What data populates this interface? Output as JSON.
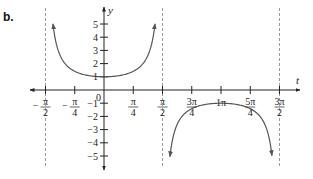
{
  "panel_label": "b.",
  "chart_data": {
    "type": "line",
    "function": "y = sec(t)",
    "title": "",
    "xlabel": "t",
    "ylabel": "y",
    "xlim": [
      -1.7,
      5.1
    ],
    "ylim": [
      -5.6,
      5.6
    ],
    "grid": false,
    "x_ticks": [
      {
        "value": -1.5708,
        "label_num": "π",
        "label_den": "2",
        "sign": "−"
      },
      {
        "value": -0.7854,
        "label_num": "π",
        "label_den": "4",
        "sign": "−"
      },
      {
        "value": 0.7854,
        "label_num": "π",
        "label_den": "4",
        "sign": ""
      },
      {
        "value": 1.5708,
        "label_num": "π",
        "label_den": "2",
        "sign": ""
      },
      {
        "value": 2.3562,
        "label_num": "3π",
        "label_den": "4",
        "sign": ""
      },
      {
        "value": 3.1416,
        "label_plain": "1π"
      },
      {
        "value": 3.927,
        "label_num": "5π",
        "label_den": "4",
        "sign": ""
      },
      {
        "value": 4.7124,
        "label_num": "3π",
        "label_den": "2",
        "sign": ""
      }
    ],
    "origin_label": "0",
    "y_ticks": [
      {
        "value": 5,
        "label": "5"
      },
      {
        "value": 4,
        "label": "4"
      },
      {
        "value": 3,
        "label": "3"
      },
      {
        "value": 2,
        "label": "2"
      },
      {
        "value": 1,
        "label": "1"
      },
      {
        "value": -1,
        "label": "−1"
      },
      {
        "value": -2,
        "label": "−2"
      },
      {
        "value": -3,
        "label": "−3"
      },
      {
        "value": -4,
        "label": "−4"
      },
      {
        "value": -5,
        "label": "−5"
      }
    ],
    "asymptotes": [
      -1.5708,
      1.5708,
      4.7124
    ],
    "series": [
      {
        "name": "upper branch",
        "domain": [
          -1.37,
          1.37
        ],
        "values_note": "sec(t) ≥ 1, minimum (0, 1)"
      },
      {
        "name": "lower branch",
        "domain": [
          1.77,
          4.51
        ],
        "values_note": "sec(t) ≤ −1, maximum (π, −1)"
      }
    ],
    "colors": {
      "curve": "#555555",
      "axes": "#222222",
      "asymptote": "#9a9a9a"
    }
  }
}
